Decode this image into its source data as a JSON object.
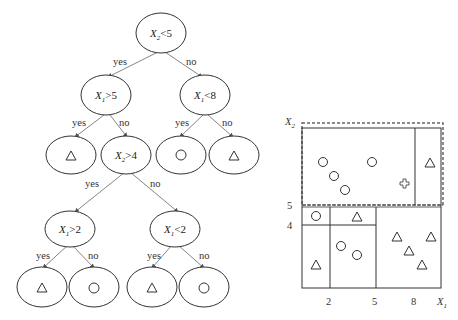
{
  "tree": {
    "root": {
      "label": "X2<5",
      "var": "X",
      "sub": "2",
      "op": "<5"
    },
    "n_left": {
      "label": "X1>5",
      "var": "X",
      "sub": "1",
      "op": ">5"
    },
    "n_right": {
      "label": "X1<8",
      "var": "X",
      "sub": "1",
      "op": "<8"
    },
    "n_mid": {
      "label": "X2>4",
      "var": "X",
      "sub": "2",
      "op": ">4"
    },
    "n_ll": {
      "label": "X1>2",
      "var": "X",
      "sub": "1",
      "op": ">2"
    },
    "n_lr": {
      "label": "X1<2",
      "var": "X",
      "sub": "1",
      "op": "<2"
    },
    "leaves": [
      "triangle",
      "circle",
      "triangle",
      "triangle",
      "circle",
      "triangle",
      "circle"
    ],
    "edge_labels": {
      "yes": "yes",
      "no": "no"
    }
  },
  "plot": {
    "x_axis_label": "X",
    "x_axis_sub": "1",
    "y_axis_label": "X",
    "y_axis_sub": "2",
    "x_ticks": [
      "2",
      "5",
      "8"
    ],
    "y_ticks": [
      "5",
      "4"
    ]
  }
}
